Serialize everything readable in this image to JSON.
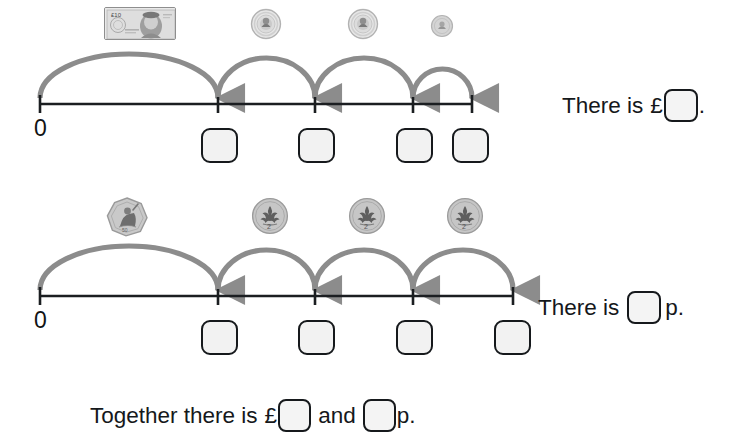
{
  "worksheet": {
    "type": "money-number-line-worksheet",
    "background_color": "#ffffff",
    "arc_color": "#8c8c8c",
    "line_color": "#1b1e21",
    "box_fill": "#f2f2f2",
    "box_border": "#16191c"
  },
  "rows": [
    {
      "id": "pounds-row",
      "zero_label": "0",
      "money_items": [
        {
          "name": "ten-pound-note",
          "label": "£10 note",
          "kind": "note",
          "value_text": "£10"
        },
        {
          "name": "one-pound-coin-1",
          "label": "£1 coin",
          "kind": "coin",
          "value_text": "£1"
        },
        {
          "name": "one-pound-coin-2",
          "label": "£1 coin",
          "kind": "coin",
          "value_text": "£1"
        },
        {
          "name": "small-coin",
          "label": "coin",
          "kind": "coin",
          "value_text": ""
        }
      ],
      "answer_boxes": [
        "",
        "",
        "",
        ""
      ],
      "sentence": {
        "lead": "There is",
        "currency": "£",
        "answer": "",
        "tail": "."
      }
    },
    {
      "id": "pence-row",
      "zero_label": "0",
      "money_items": [
        {
          "name": "fifty-pence-coin",
          "label": "50p coin",
          "kind": "coin",
          "value_text": "50p"
        },
        {
          "name": "two-pence-coin-1",
          "label": "2p coin",
          "kind": "coin",
          "value_text": "2p"
        },
        {
          "name": "two-pence-coin-2",
          "label": "2p coin",
          "kind": "coin",
          "value_text": "2p"
        },
        {
          "name": "two-pence-coin-3",
          "label": "2p coin",
          "kind": "coin",
          "value_text": "2p"
        }
      ],
      "answer_boxes": [
        "",
        "",
        "",
        ""
      ],
      "sentence": {
        "lead": "There is",
        "currency": "",
        "answer": "",
        "tail": "p."
      }
    }
  ],
  "total_sentence": {
    "lead": "Together there is",
    "currency": "£",
    "pounds_answer": "",
    "joiner": "and",
    "pence_answer": "",
    "tail": "p."
  }
}
